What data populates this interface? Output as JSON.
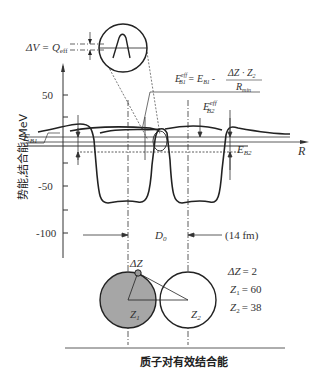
{
  "diagram": {
    "caption": "质子对有效结合能",
    "y_axis": {
      "label": "势能,结合能/MeV",
      "ticks": [
        {
          "value": "50",
          "y": 95
        },
        {
          "value": "-50",
          "y": 186
        },
        {
          "value": "-100",
          "y": 233
        }
      ]
    },
    "x_axis": {
      "label": "R"
    },
    "labels": {
      "delta_v": "ΔV = Q",
      "delta_v_sub": "eff",
      "eb1": "E",
      "eb1_sub": "B1",
      "eb2": "E",
      "eb2_sub": "B2",
      "eb2_eff": "E",
      "eb2_eff_sup": "eff",
      "eb2_eff_sub": "B2",
      "formula_lhs": "E",
      "formula_lhs_sup": "eff",
      "formula_lhs_sub": "B1",
      "formula_eq": "= E",
      "formula_eq_sub": "B1",
      "formula_minus": "-",
      "formula_num": "ΔZ · Z",
      "formula_num_sub": "2",
      "formula_den": "R",
      "formula_den_sub": "min",
      "d0": "D",
      "d0_sub": "0",
      "distance": "(14 fm)",
      "delta_z": "ΔZ",
      "z1": "Z",
      "z1_sub": "1",
      "z2": "Z",
      "z2_sub": "2"
    },
    "parameters": [
      {
        "name": "ΔZ",
        "sub": "",
        "value": "= 2"
      },
      {
        "name": "Z",
        "sub": "1",
        "value": "= 60"
      },
      {
        "name": "Z",
        "sub": "2",
        "value": "= 38"
      }
    ]
  }
}
